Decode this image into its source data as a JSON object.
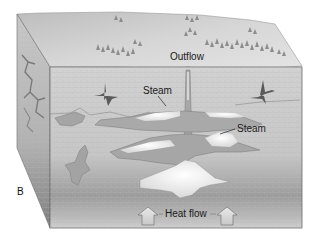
{
  "figure": {
    "panel_letter": "B",
    "labels": {
      "outflow": "Outflow",
      "steam_upper": "Steam",
      "steam_lower": "Steam",
      "heat_flow": "Heat flow"
    },
    "icons": {
      "heat_arrow_left": "up-arrow-icon",
      "heat_arrow_right": "up-arrow-icon"
    },
    "colors": {
      "background": "#ffffff",
      "surface": "#cfcfcf",
      "front_face": "#c4c4c4",
      "side_face": "#b3b3b3",
      "bottom_shade": "#8e8e8e",
      "steam": "#f4f4f4",
      "water_fracture": "#a9a9a9",
      "dark_fracture": "#5e5e5e",
      "trees": "#8a8a8a",
      "outline": "#555555"
    }
  }
}
